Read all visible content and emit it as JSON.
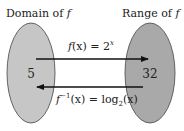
{
  "domain_label": {
    "prefix": "Domain of ",
    "var": "f"
  },
  "range_label": {
    "prefix": "Range of ",
    "var": "f"
  },
  "domain_value": "5",
  "range_value": "32",
  "forward_function": {
    "lhs_fn": "f",
    "lhs_arg": "(x)",
    "eq": " = ",
    "base": "2",
    "exp": "x"
  },
  "inverse_function": {
    "lhs_fn": "f",
    "lhs_sup": "−1",
    "lhs_arg": "(x)",
    "eq": " = ",
    "log": "log",
    "log_base": "2",
    "rhs_arg": "(x)"
  },
  "colors": {
    "domain_fill": "#c6c6c6",
    "range_fill": "#a9a9a9",
    "outline": "#555555",
    "arrow": "#111111"
  }
}
